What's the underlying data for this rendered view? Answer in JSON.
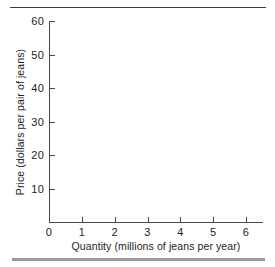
{
  "chart_data": {
    "type": "line",
    "title": "",
    "subtitle": "",
    "xlabel": "Quantity (millions of jeans per year)",
    "ylabel": "Price (dollars per pair of jeans)",
    "xlim": [
      0,
      6.4
    ],
    "ylim": [
      0,
      60
    ],
    "x_ticks": [
      0,
      1,
      2,
      3,
      4,
      5,
      6
    ],
    "x_tick_labels": [
      "0",
      "1",
      "2",
      "3",
      "4",
      "5",
      "6"
    ],
    "y_ticks": [
      10,
      20,
      30,
      40,
      50,
      60
    ],
    "y_tick_labels": [
      "10",
      "20",
      "30",
      "40",
      "50",
      "60"
    ],
    "grid": false,
    "legend": null,
    "series": [],
    "annotations": [],
    "note": "Empty axes template; no data plotted in the figure."
  },
  "decoration": {
    "top_rule": "",
    "bottom_rule": ""
  },
  "colors": {
    "axis": "#4a4a4a",
    "text": "#1d1d1d",
    "rule_top": "#3b3b3b",
    "rule_bottom": "#9a9a9a",
    "background": "#ffffff"
  }
}
